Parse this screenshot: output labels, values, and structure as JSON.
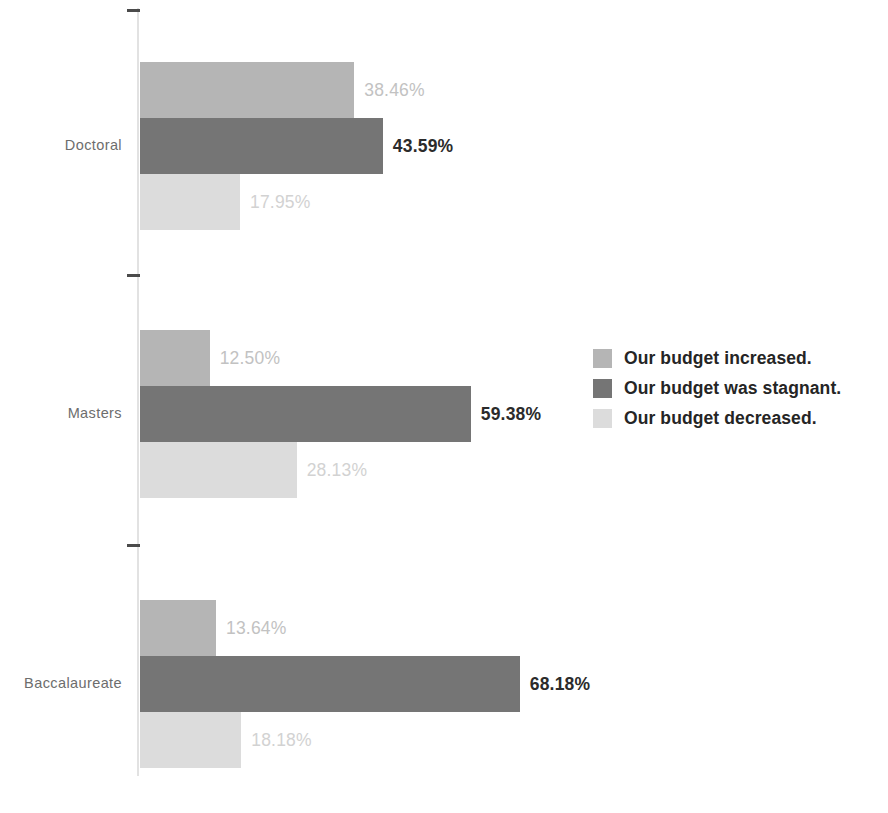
{
  "chart_data": {
    "type": "bar",
    "orientation": "horizontal",
    "title": "",
    "subtitle": "",
    "xlabel": "",
    "ylabel": "",
    "grid": false,
    "axis_line": true,
    "xlim": [
      0,
      100
    ],
    "value_suffix": "%",
    "legend_position": "right",
    "categories": [
      "Doctoral",
      "Masters",
      "Baccalaureate"
    ],
    "series": [
      {
        "name": "Our budget increased.",
        "color": "#b5b5b5",
        "label_color": "#c2c2c2",
        "values": [
          38.46,
          12.5,
          13.64
        ],
        "labels": [
          "38.46%",
          "12.50%",
          "13.64%"
        ]
      },
      {
        "name": "Our budget was stagnant.",
        "color": "#757575",
        "label_color": "#2b2b2b",
        "values": [
          43.59,
          59.38,
          68.18
        ],
        "labels": [
          "43.59%",
          "59.38%",
          "68.18%"
        ]
      },
      {
        "name": "Our budget decreased.",
        "color": "#dcdcdc",
        "label_color": "#d2d2d2",
        "values": [
          17.95,
          28.13,
          18.18
        ],
        "labels": [
          "17.95%",
          "28.13%",
          "18.18%"
        ]
      }
    ]
  },
  "axis": {
    "tick_count": 3,
    "tick_color": "#4a4a4a",
    "line_color": "#e2e2e2"
  },
  "legend": {
    "items": [
      {
        "label": "Our budget increased.",
        "color": "#b5b5b5"
      },
      {
        "label": "Our budget was stagnant.",
        "color": "#757575"
      },
      {
        "label": "Our budget decreased.",
        "color": "#dcdcdc"
      }
    ]
  },
  "layout": {
    "axis_x": 140,
    "px_per_percent": 5.57,
    "bar_height": 56,
    "group_tops": [
      62,
      330,
      600
    ],
    "tick_ys": [
      9,
      274,
      544
    ],
    "label_gap": 10
  }
}
